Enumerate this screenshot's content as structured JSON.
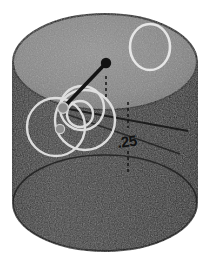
{
  "figure": {
    "background_color": "#ffffff",
    "canvas": {
      "width": 212,
      "height": 275
    }
  },
  "geometry": {
    "cylinder": {
      "center_x": 105,
      "top_ellipse_center_y": 62,
      "bottom_ellipse_center_y": 203,
      "radius_x": 92,
      "radius_y": 48,
      "left_edge_x": 13,
      "right_edge_x": 197,
      "top_edge_y": 14,
      "bottom_edge_y": 251
    },
    "colors": {
      "top_face": "#8a8a8a",
      "top_face_shadow": "#7b7b7b",
      "side_wall": "#3c3c3c",
      "side_wall_dark": "#2e2e2e",
      "outline": "#1d1d1d",
      "annotation_white": "#e8e8e8",
      "annotation_dark": "#141414",
      "label_text": "#101010"
    }
  },
  "annotations": {
    "dimension_label": ".25",
    "dimension_label_x": 118,
    "dimension_label_y": 143,
    "leader_dot": {
      "x": 106,
      "y": 63,
      "r": 5
    },
    "leader_line": {
      "x1": 106,
      "y1": 63,
      "x2": 63,
      "y2": 108
    },
    "hub_dot": {
      "x": 63,
      "y": 108,
      "r": 5
    },
    "small_dot": {
      "x": 60,
      "y": 129,
      "r": 4.5
    },
    "tick_marks": [
      {
        "x": 106,
        "y1": 78,
        "y2": 98
      },
      {
        "x": 128,
        "y1": 103,
        "y2": 127
      },
      {
        "x": 128,
        "y1": 152,
        "y2": 172
      }
    ],
    "circles_white": [
      {
        "name": "top-face-circle",
        "cx": 150,
        "cy": 47,
        "rx": 20,
        "ry": 23
      },
      {
        "name": "feature-circle-large",
        "cx": 85,
        "cy": 120,
        "rx": 30,
        "ry": 30
      },
      {
        "name": "feature-circle-mid",
        "cx": 82,
        "cy": 108,
        "rx": 22,
        "ry": 22
      },
      {
        "name": "feature-circle-left",
        "cx": 56,
        "cy": 127,
        "rx": 29,
        "ry": 29
      },
      {
        "name": "feature-circle-small",
        "cx": 80,
        "cy": 114,
        "rx": 13,
        "ry": 13
      }
    ],
    "sweep_lines": [
      {
        "x1": 63,
        "y1": 108,
        "x2": 186,
        "y2": 132
      },
      {
        "x1": 63,
        "y1": 112,
        "x2": 178,
        "y2": 152
      }
    ]
  }
}
